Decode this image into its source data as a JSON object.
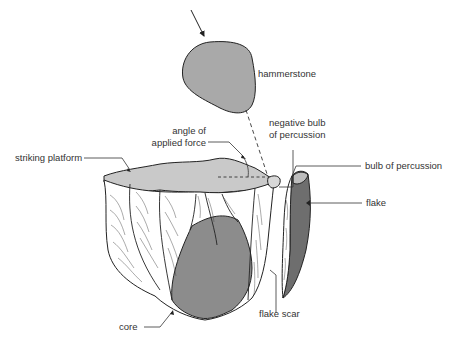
{
  "diagram": {
    "type": "illustration",
    "labels": {
      "hammerstone": "hammerstone",
      "angle_line1": "angle of",
      "angle_line2": "applied force",
      "neg_bulb_line1": "negative bulb",
      "neg_bulb_line2": "of percussion",
      "striking_platform": "striking platform",
      "bulb_of_percussion": "bulb of percussion",
      "flake": "flake",
      "flake_scar": "flake scar",
      "core": "core"
    },
    "colors": {
      "hammerstone": "#a9a9a9",
      "platform": "#c9c9c9",
      "core_face": "#8c8c8c",
      "flake_dark": "#6e6e6e",
      "flake_bulb": "#bdbdbd",
      "scar_white": "#ffffff",
      "line": "#222222"
    }
  }
}
